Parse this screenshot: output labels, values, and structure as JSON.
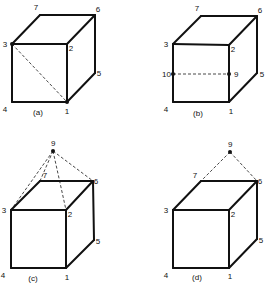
{
  "panels": [
    {
      "caption": "(a)",
      "vertex_labels": {
        "1": "1",
        "2": "2",
        "3": "3",
        "4": "4",
        "5": "5",
        "6": "6",
        "7": "7"
      },
      "extra_points": [],
      "dashed_lines": [
        [
          "3",
          "1"
        ]
      ],
      "marked_points": [
        "3",
        "1"
      ]
    },
    {
      "caption": "(b)",
      "vertex_labels": {
        "1": "1",
        "2": "2",
        "3": "3",
        "4": "4",
        "5": "5",
        "6": "6",
        "7": "7"
      },
      "extra_points": [
        {
          "id": "9",
          "label": "9",
          "on_edge": [
            "2",
            "1"
          ]
        },
        {
          "id": "10",
          "label": "10",
          "on_edge": [
            "3",
            "4"
          ]
        }
      ],
      "dashed_lines": [
        [
          "10",
          "9"
        ]
      ],
      "marked_points": [
        "10",
        "9"
      ]
    },
    {
      "caption": "(c)",
      "vertex_labels": {
        "1": "1",
        "2": "2",
        "3": "3",
        "4": "4",
        "5": "5",
        "6": "6",
        "7": "7"
      },
      "extra_points": [
        {
          "id": "9",
          "label": "9",
          "position": "above cube"
        }
      ],
      "dashed_lines": [
        [
          "9",
          "3"
        ],
        [
          "9",
          "7"
        ],
        [
          "9",
          "2"
        ],
        [
          "9",
          "6"
        ]
      ],
      "marked_points": [
        "9"
      ]
    },
    {
      "caption": "(d)",
      "vertex_labels": {
        "1": "1",
        "2": "2",
        "3": "3",
        "4": "4",
        "5": "5",
        "6": "6",
        "7": "7"
      },
      "extra_points": [
        {
          "id": "9",
          "label": "9",
          "position": "above cube"
        }
      ],
      "dashed_lines": [
        [
          "9",
          "7"
        ],
        [
          "9",
          "6"
        ]
      ],
      "marked_points": [
        "9"
      ]
    }
  ],
  "colors": {
    "line": "#111111",
    "background": "#ffffff"
  }
}
